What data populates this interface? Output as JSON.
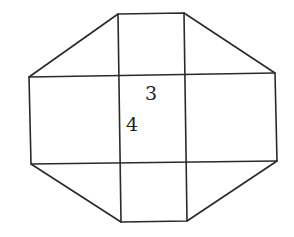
{
  "diagram": {
    "type": "octagon-net",
    "labels": [
      {
        "text": "3",
        "x": 146,
        "y": 100,
        "refers_to": "top edge of central rectangle"
      },
      {
        "text": "4",
        "x": 126,
        "y": 130,
        "refers_to": "left edge of central rectangle"
      }
    ],
    "colors": {
      "stroke": "#2a2a2a",
      "text": "#222222",
      "background": "#ffffff"
    }
  }
}
